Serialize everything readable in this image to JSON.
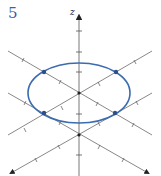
{
  "problem": {
    "number": "5"
  },
  "axes": {
    "z_label": "z"
  },
  "colors": {
    "curve": "#3b6bb0",
    "axis": "#555555",
    "points": "#2b4f8a",
    "number": "#3d5fa6"
  },
  "figure": {
    "curve": {
      "type": "ellipse",
      "cx": 79,
      "cy": 93,
      "rx": 51,
      "ry": 30
    },
    "marked_points": 4
  }
}
